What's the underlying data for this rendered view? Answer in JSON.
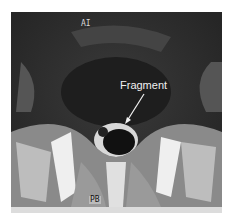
{
  "image": {
    "type": "axial MRI slice",
    "labels": {
      "orientation_top": "AI",
      "orientation_bottom": "PB",
      "annotation": "Fragment"
    }
  }
}
